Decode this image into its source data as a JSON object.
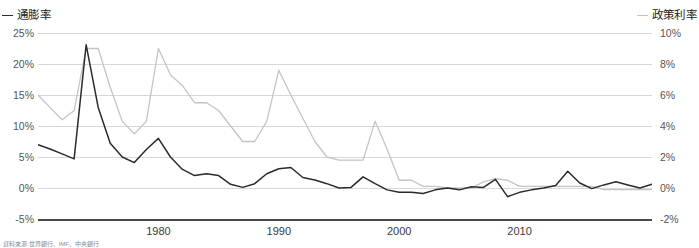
{
  "legend": {
    "left": {
      "label": "通膨率",
      "color": "#2b2b2b",
      "marker": "line-dash-icon"
    },
    "right": {
      "label": "政策利率",
      "color": "#c4c4c4",
      "marker": "line-dash-icon"
    }
  },
  "axis": {
    "left_ticks": [
      "25%",
      "20%",
      "15%",
      "10%",
      "5%",
      "0%",
      "-5%"
    ],
    "right_ticks": [
      "10%",
      "8%",
      "6%",
      "4%",
      "2%",
      "0%",
      "-2%"
    ],
    "x_ticks": [
      "1980",
      "1990",
      "2000",
      "2010"
    ]
  },
  "footnote": "資料來源:世界銀行、IMF、中央銀行",
  "chart_data": {
    "type": "line",
    "title": "",
    "xlabel": "",
    "ylabel": "通膨率",
    "y2label": "政策利率",
    "grid": true,
    "legend_position": "top",
    "xlim": [
      1970,
      2021
    ],
    "ylim": [
      -5,
      25
    ],
    "y2lim": [
      -2,
      10
    ],
    "xticks": [
      1980,
      1990,
      2000,
      2010
    ],
    "yticks": [
      -5,
      0,
      5,
      10,
      15,
      20,
      25
    ],
    "y2ticks": [
      -2,
      0,
      2,
      4,
      6,
      8,
      10
    ],
    "x": [
      1970,
      1971,
      1972,
      1973,
      1974,
      1975,
      1976,
      1977,
      1978,
      1979,
      1980,
      1981,
      1982,
      1983,
      1984,
      1985,
      1986,
      1987,
      1988,
      1989,
      1990,
      1991,
      1992,
      1993,
      1994,
      1995,
      1996,
      1997,
      1998,
      1999,
      2000,
      2001,
      2002,
      2003,
      2004,
      2005,
      2006,
      2007,
      2008,
      2009,
      2010,
      2011,
      2012,
      2013,
      2014,
      2015,
      2016,
      2017,
      2018,
      2019,
      2020,
      2021
    ],
    "series": [
      {
        "name": "通膨率",
        "axis": "left",
        "color": "#2b2b2b",
        "values": [
          7.0,
          6.3,
          5.5,
          4.7,
          23.1,
          13.0,
          7.2,
          5.0,
          4.1,
          6.2,
          8.0,
          5.0,
          3.0,
          2.0,
          2.3,
          2.0,
          0.6,
          0.1,
          0.7,
          2.3,
          3.1,
          3.3,
          1.7,
          1.3,
          0.7,
          0.0,
          0.1,
          1.8,
          0.7,
          -0.3,
          -0.7,
          -0.7,
          -0.9,
          -0.3,
          0.0,
          -0.3,
          0.2,
          0.1,
          1.4,
          -1.4,
          -0.7,
          -0.3,
          0.0,
          0.4,
          2.7,
          0.8,
          -0.1,
          0.5,
          1.0,
          0.5,
          0.0,
          0.6
        ]
      },
      {
        "name": "政策利率",
        "axis": "right",
        "color": "#c4c4c4",
        "values": [
          6.0,
          5.2,
          4.4,
          5.0,
          9.0,
          9.0,
          6.5,
          4.3,
          3.5,
          4.3,
          9.0,
          7.3,
          6.6,
          5.5,
          5.5,
          5.0,
          4.0,
          3.0,
          3.0,
          4.3,
          7.6,
          6.0,
          4.5,
          3.0,
          2.0,
          1.8,
          1.8,
          1.8,
          4.3,
          2.5,
          0.5,
          0.5,
          0.1,
          0.1,
          0.0,
          0.0,
          0.0,
          0.4,
          0.6,
          0.5,
          0.1,
          0.1,
          0.1,
          0.1,
          0.1,
          0.1,
          0.1,
          -0.1,
          -0.1,
          -0.1,
          -0.1,
          -0.1
        ]
      }
    ]
  }
}
